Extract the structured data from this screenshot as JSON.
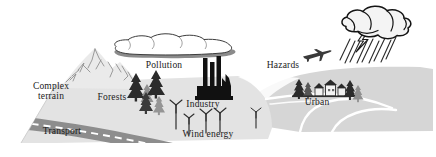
{
  "figure": {
    "kind": "landscape-schematic-diagram",
    "width": 436,
    "height": 157,
    "background_color": "#ffffff"
  },
  "palette": {
    "terrain_front": "#e2e2e2",
    "terrain_back": "#d2d2d2",
    "terrain_mid": "#dadada",
    "road": "#8c8c8c",
    "road_dash": "#ffffff",
    "mountain": "#e8e8e8",
    "mountain_line": "#8e8e8e",
    "cloud_body": "#ffffff",
    "cloud_shadow": "#8a8a8a",
    "cloud_outline": "#3a3a3a",
    "storm_body": "#f2f2f2",
    "storm_outline": "#1a1a1a",
    "rain": "#2b2b2b",
    "tree_dark": "#2b2b2b",
    "tree_light": "#8e8e8e",
    "industry": "#111111",
    "turbine": "#2b2b2b",
    "river": "#ffffff",
    "label_text": "#1a1a1a"
  },
  "labels": [
    {
      "id": "complex-terrain",
      "line1": "Complex",
      "line2": "terrain",
      "x": 50,
      "y": 86
    },
    {
      "id": "forests",
      "text": "Forests",
      "x": 112,
      "y": 97
    },
    {
      "id": "transport",
      "text": "Transport",
      "x": 59,
      "y": 131
    },
    {
      "id": "pollution",
      "text": "Pollution",
      "x": 163,
      "y": 65
    },
    {
      "id": "industry",
      "text": "Industry",
      "x": 202,
      "y": 104
    },
    {
      "id": "wind-energy",
      "text": "Wind energy",
      "x": 207,
      "y": 134
    },
    {
      "id": "hazards",
      "text": "Hazards",
      "x": 283,
      "y": 65
    },
    {
      "id": "urban",
      "text": "Urban",
      "x": 315,
      "y": 102
    }
  ],
  "features": [
    {
      "id": "mountain",
      "name": "Complex terrain mountain peaks"
    },
    {
      "id": "forest-trees",
      "name": "Coniferous forest trees",
      "count": 5
    },
    {
      "id": "road",
      "name": "Transport road with dashed centre line"
    },
    {
      "id": "pollution-cloud",
      "name": "Flat pollution cloud layer"
    },
    {
      "id": "factory",
      "name": "Industry factory silhouette",
      "smokestacks": 3
    },
    {
      "id": "wind-turbines",
      "name": "Wind energy turbines",
      "count": 5
    },
    {
      "id": "airplane",
      "name": "Aircraft hazard symbol"
    },
    {
      "id": "storm-cloud",
      "name": "Thunderstorm cloud with lightning and rain"
    },
    {
      "id": "urban-cluster",
      "name": "Urban settlement houses and trees"
    },
    {
      "id": "river",
      "name": "River / valley channels"
    }
  ]
}
